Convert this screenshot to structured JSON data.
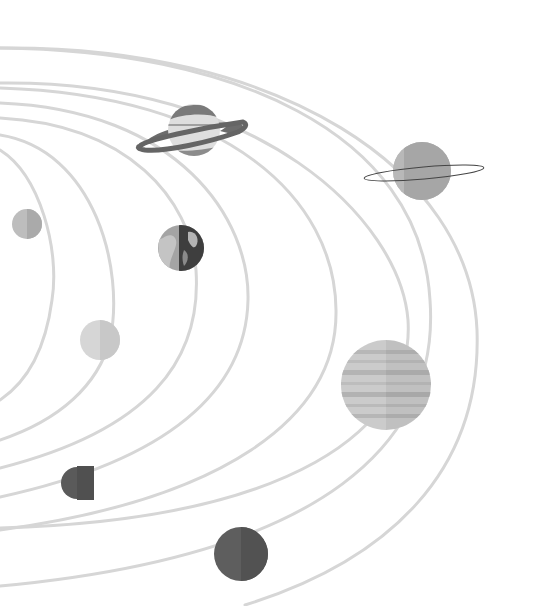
{
  "illustration": {
    "title": "",
    "description": "Grayscale solar system illustration with curved orbit lines and planets",
    "background_color": "#ffffff",
    "orbit_color": "#d6d6d6",
    "planets": [
      {
        "name": "mercury",
        "shade": "#b8b8b8",
        "shade_dark": "#a8a8a8"
      },
      {
        "name": "venus",
        "shade": "#d4d4d4",
        "shade_dark": "#c6c6c6"
      },
      {
        "name": "earth",
        "shade": "#9c9c9c",
        "shade_dark": "#3e3e3e"
      },
      {
        "name": "mars",
        "shade": "#585858",
        "shade_dark": "#4e4e4e"
      },
      {
        "name": "jupiter",
        "shade": "#c9c9c9",
        "shade_dark": "#b9b9b9"
      },
      {
        "name": "saturn",
        "shade": "#dcdcdc",
        "shade_dark": "#6a6a6a"
      },
      {
        "name": "uranus",
        "shade": "#b4b4b4",
        "shade_dark": "#a2a2a2"
      },
      {
        "name": "neptune",
        "shade": "#5c5c5c",
        "shade_dark": "#505050"
      }
    ]
  }
}
